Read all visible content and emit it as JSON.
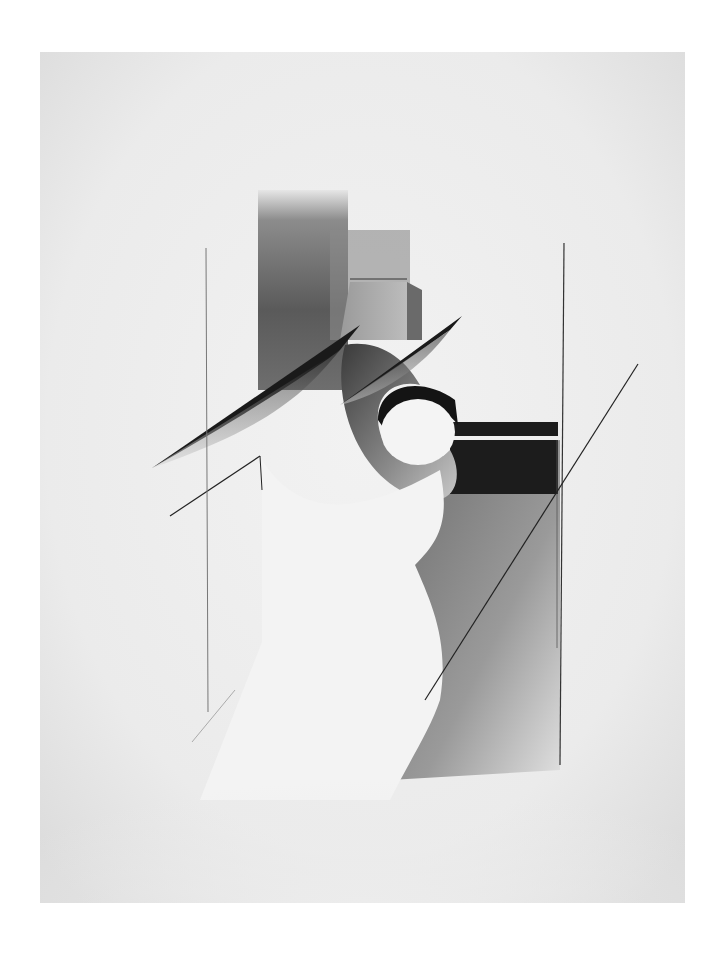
{
  "artwork": {
    "kind": "abstract constructivist drawing",
    "medium_appearance": "graphite / charcoal on paper",
    "colors": {
      "background": "#ffffff",
      "paper": "#eeeeee",
      "dark": "#1c1c1c",
      "mid": "#7a7a7a",
      "light_shade": "#bdbdbd"
    },
    "elements": [
      "vertical-dark-column",
      "rectangular-block",
      "upper-left-blade",
      "upper-right-blade",
      "curved-crescent-ring",
      "white-ellipse-opening",
      "horizontal-black-bar",
      "black-triangle-wedge",
      "white-curved-body",
      "gray-right-field",
      "left-vertical-line",
      "right-vertical-line",
      "diagonal-line-right",
      "diagonal-line-left"
    ]
  }
}
